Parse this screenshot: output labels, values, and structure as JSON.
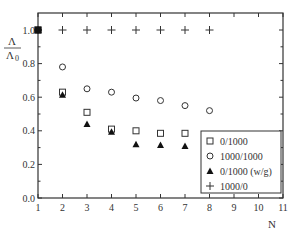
{
  "chart_data": {
    "type": "scatter",
    "title": "",
    "xlabel": "N",
    "ylabel_num": "Λ",
    "ylabel_den": "Λ",
    "ylabel_den_sub": "0",
    "xlim": [
      1,
      11
    ],
    "ylim": [
      0.0,
      1.1
    ],
    "x_ticks": [
      "1",
      "2",
      "3",
      "4",
      "5",
      "6",
      "7",
      "8",
      "9",
      "10",
      "11"
    ],
    "y_ticks": [
      "0.0",
      "0.2",
      "0.4",
      "0.6",
      "0.8",
      "1.0"
    ],
    "grid": false,
    "legend_position": "bottom-right",
    "series": [
      {
        "name": "0/1000",
        "marker": "open-square",
        "x": [
          1,
          2,
          3,
          4,
          5,
          6,
          7
        ],
        "y": [
          1.0,
          0.63,
          0.51,
          0.41,
          0.4,
          0.385,
          0.385
        ]
      },
      {
        "name": "1000/1000",
        "marker": "open-circle",
        "x": [
          1,
          2,
          3,
          4,
          5,
          6,
          7,
          8
        ],
        "y": [
          1.0,
          0.78,
          0.65,
          0.63,
          0.595,
          0.58,
          0.55,
          0.52
        ]
      },
      {
        "name": "0/1000 (w/g)",
        "marker": "filled-triangle",
        "x": [
          1,
          2,
          3,
          4,
          5,
          6,
          7
        ],
        "y": [
          1.0,
          0.615,
          0.44,
          0.395,
          0.32,
          0.315,
          0.31
        ]
      },
      {
        "name": "1000/0",
        "marker": "plus",
        "x": [
          1,
          2,
          3,
          4,
          5,
          6,
          7,
          8
        ],
        "y": [
          1.0,
          1.0,
          1.0,
          1.0,
          1.0,
          1.0,
          1.0,
          1.0
        ]
      }
    ]
  }
}
